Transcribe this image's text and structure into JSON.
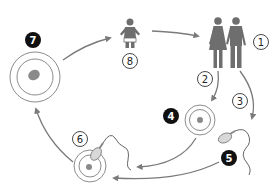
{
  "diagram": {
    "type": "human-life-cycle",
    "colors": {
      "figure": "#6e6e6e",
      "arrow": "#7a7a7a",
      "ring": "#8c8c8c",
      "nucleus": "#8a8a8a",
      "badge_solid": "#111111",
      "badge_open_stroke": "#333333"
    },
    "steps": [
      {
        "id": 1,
        "label": "1",
        "style": "open",
        "depicts": "adult-couple"
      },
      {
        "id": 2,
        "label": "2",
        "style": "open",
        "depicts": "arrow-to-egg"
      },
      {
        "id": 3,
        "label": "3",
        "style": "open",
        "depicts": "arrow-to-sperm"
      },
      {
        "id": 4,
        "label": "4",
        "style": "solid",
        "depicts": "egg-cell"
      },
      {
        "id": 5,
        "label": "5",
        "style": "solid",
        "depicts": "sperm-cell"
      },
      {
        "id": 6,
        "label": "6",
        "style": "open",
        "depicts": "fertilization"
      },
      {
        "id": 7,
        "label": "7",
        "style": "solid",
        "depicts": "zygote"
      },
      {
        "id": 8,
        "label": "8",
        "style": "open",
        "depicts": "infant"
      }
    ]
  }
}
